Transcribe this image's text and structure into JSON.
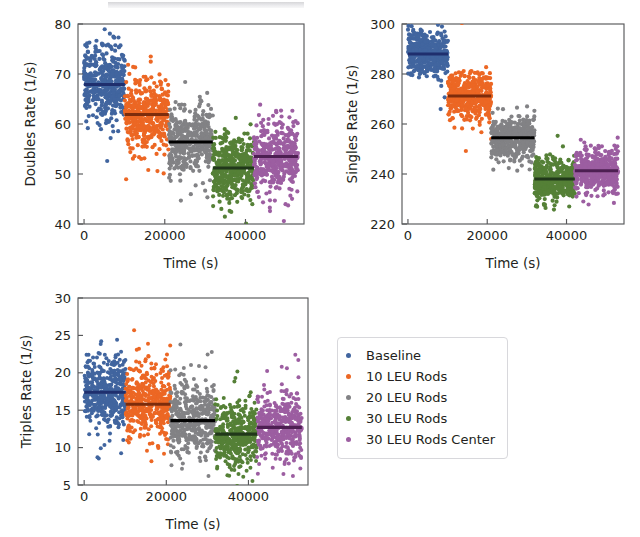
{
  "figure": {
    "background": "#ffffff",
    "scan_artifact": true
  },
  "groups": [
    {
      "key": "baseline",
      "label": "Baseline",
      "color": "#41659f",
      "mean_color": "#1f2f6e",
      "t_start": 0,
      "t_end": 10100
    },
    {
      "key": "leu10",
      "label": "10 LEU Rods",
      "color": "#ec6724",
      "mean_color": "#7d2c0c",
      "t_start": 10100,
      "t_end": 21000
    },
    {
      "key": "leu20",
      "label": "20 LEU Rods",
      "color": "#828285",
      "mean_color": "#000000",
      "t_start": 21000,
      "t_end": 31900
    },
    {
      "key": "leu30",
      "label": "30 LEU Rods",
      "color": "#558037",
      "mean_color": "#21381a",
      "t_start": 31900,
      "t_end": 42100
    },
    {
      "key": "leu30c",
      "label": "30 LEU Rods Center",
      "color": "#9c5ea1",
      "mean_color": "#4d1f52",
      "t_start": 42100,
      "t_end": 53000
    }
  ],
  "chart_data": [
    {
      "type": "scatter",
      "id": "doubles",
      "title": "",
      "xlabel": "Time (s)",
      "ylabel": "Doubles Rate (1/s)",
      "xlim": [
        -1500,
        54500
      ],
      "ylim": [
        40,
        80
      ],
      "xticks": [
        0,
        20000,
        40000
      ],
      "xticklabels": [
        "0",
        "20000",
        "40000"
      ],
      "yticks": [
        40,
        50,
        60,
        70,
        80
      ],
      "yticklabels": [
        "40",
        "50",
        "60",
        "70",
        "80"
      ],
      "grid": false,
      "legend": "none",
      "series": [
        {
          "name": "Baseline",
          "mean": 67.9,
          "sd": 3.6,
          "n": 430,
          "outlier_sd": 6.0,
          "outlier_frac": 0.04
        },
        {
          "name": "10 LEU Rods",
          "mean": 61.9,
          "sd": 3.6,
          "n": 430,
          "outlier_sd": 6.3,
          "outlier_frac": 0.05
        },
        {
          "name": "20 LEU Rods",
          "mean": 56.4,
          "sd": 3.4,
          "n": 430,
          "outlier_sd": 5.8,
          "outlier_frac": 0.05
        },
        {
          "name": "30 LEU Rods",
          "mean": 51.2,
          "sd": 3.2,
          "n": 430,
          "outlier_sd": 5.4,
          "outlier_frac": 0.05
        },
        {
          "name": "30 LEU Rods Center",
          "mean": 53.5,
          "sd": 3.4,
          "n": 430,
          "outlier_sd": 5.6,
          "outlier_frac": 0.05
        }
      ]
    },
    {
      "type": "scatter",
      "id": "singles",
      "title": "",
      "xlabel": "Time (s)",
      "ylabel": "Singles Rate (1/s)",
      "xlim": [
        -1500,
        54500
      ],
      "ylim": [
        220,
        300
      ],
      "xticks": [
        0,
        20000,
        40000
      ],
      "xticklabels": [
        "0",
        "20000",
        "40000"
      ],
      "yticks": [
        220,
        240,
        260,
        280,
        300
      ],
      "yticklabels": [
        "220",
        "240",
        "260",
        "280",
        "300"
      ],
      "grid": false,
      "legend": "none",
      "series": [
        {
          "name": "Baseline",
          "mean": 288.0,
          "sd": 4.6,
          "n": 430,
          "outlier_sd": 7.5,
          "outlier_frac": 0.03
        },
        {
          "name": "10 LEU Rods",
          "mean": 271.2,
          "sd": 4.6,
          "n": 430,
          "outlier_sd": 7.3,
          "outlier_frac": 0.03
        },
        {
          "name": "20 LEU Rods",
          "mean": 254.5,
          "sd": 4.4,
          "n": 430,
          "outlier_sd": 7.0,
          "outlier_frac": 0.04
        },
        {
          "name": "30 LEU Rods",
          "mean": 238.0,
          "sd": 4.2,
          "n": 430,
          "outlier_sd": 6.6,
          "outlier_frac": 0.03
        },
        {
          "name": "30 LEU Rods Center",
          "mean": 241.3,
          "sd": 4.3,
          "n": 430,
          "outlier_sd": 6.5,
          "outlier_frac": 0.03
        }
      ]
    },
    {
      "type": "scatter",
      "id": "triples",
      "title": "",
      "xlabel": "Time (s)",
      "ylabel": "Triples Rate (1/s)",
      "xlim": [
        -1500,
        54500
      ],
      "ylim": [
        5,
        30
      ],
      "xticks": [
        0,
        20000,
        40000
      ],
      "xticklabels": [
        "0",
        "20000",
        "40000"
      ],
      "yticks": [
        5,
        10,
        15,
        20,
        25,
        30
      ],
      "yticklabels": [
        "5",
        "10",
        "15",
        "20",
        "25",
        "30"
      ],
      "grid": false,
      "legend": "right",
      "series": [
        {
          "name": "Baseline",
          "mean": 17.4,
          "sd": 2.5,
          "n": 430,
          "outlier_sd": 4.6,
          "outlier_frac": 0.07
        },
        {
          "name": "10 LEU Rods",
          "mean": 15.8,
          "sd": 2.4,
          "n": 430,
          "outlier_sd": 4.6,
          "outlier_frac": 0.08
        },
        {
          "name": "20 LEU Rods",
          "mean": 13.6,
          "sd": 2.3,
          "n": 430,
          "outlier_sd": 4.8,
          "outlier_frac": 0.08
        },
        {
          "name": "30 LEU Rods",
          "mean": 11.8,
          "sd": 2.2,
          "n": 430,
          "outlier_sd": 4.8,
          "outlier_frac": 0.08
        },
        {
          "name": "30 LEU Rods Center",
          "mean": 12.7,
          "sd": 2.2,
          "n": 430,
          "outlier_sd": 4.6,
          "outlier_frac": 0.08
        }
      ]
    }
  ],
  "legend": {
    "position": "right-of-triples-panel",
    "items": [
      {
        "label": "Baseline",
        "color": "#41659f",
        "marker": "circle"
      },
      {
        "label": "10 LEU Rods",
        "color": "#ec6724",
        "marker": "circle"
      },
      {
        "label": "20 LEU Rods",
        "color": "#828285",
        "marker": "circle"
      },
      {
        "label": "30 LEU Rods",
        "color": "#558037",
        "marker": "circle"
      },
      {
        "label": "30 LEU Rods Center",
        "color": "#9c5ea1",
        "marker": "circle"
      }
    ]
  }
}
